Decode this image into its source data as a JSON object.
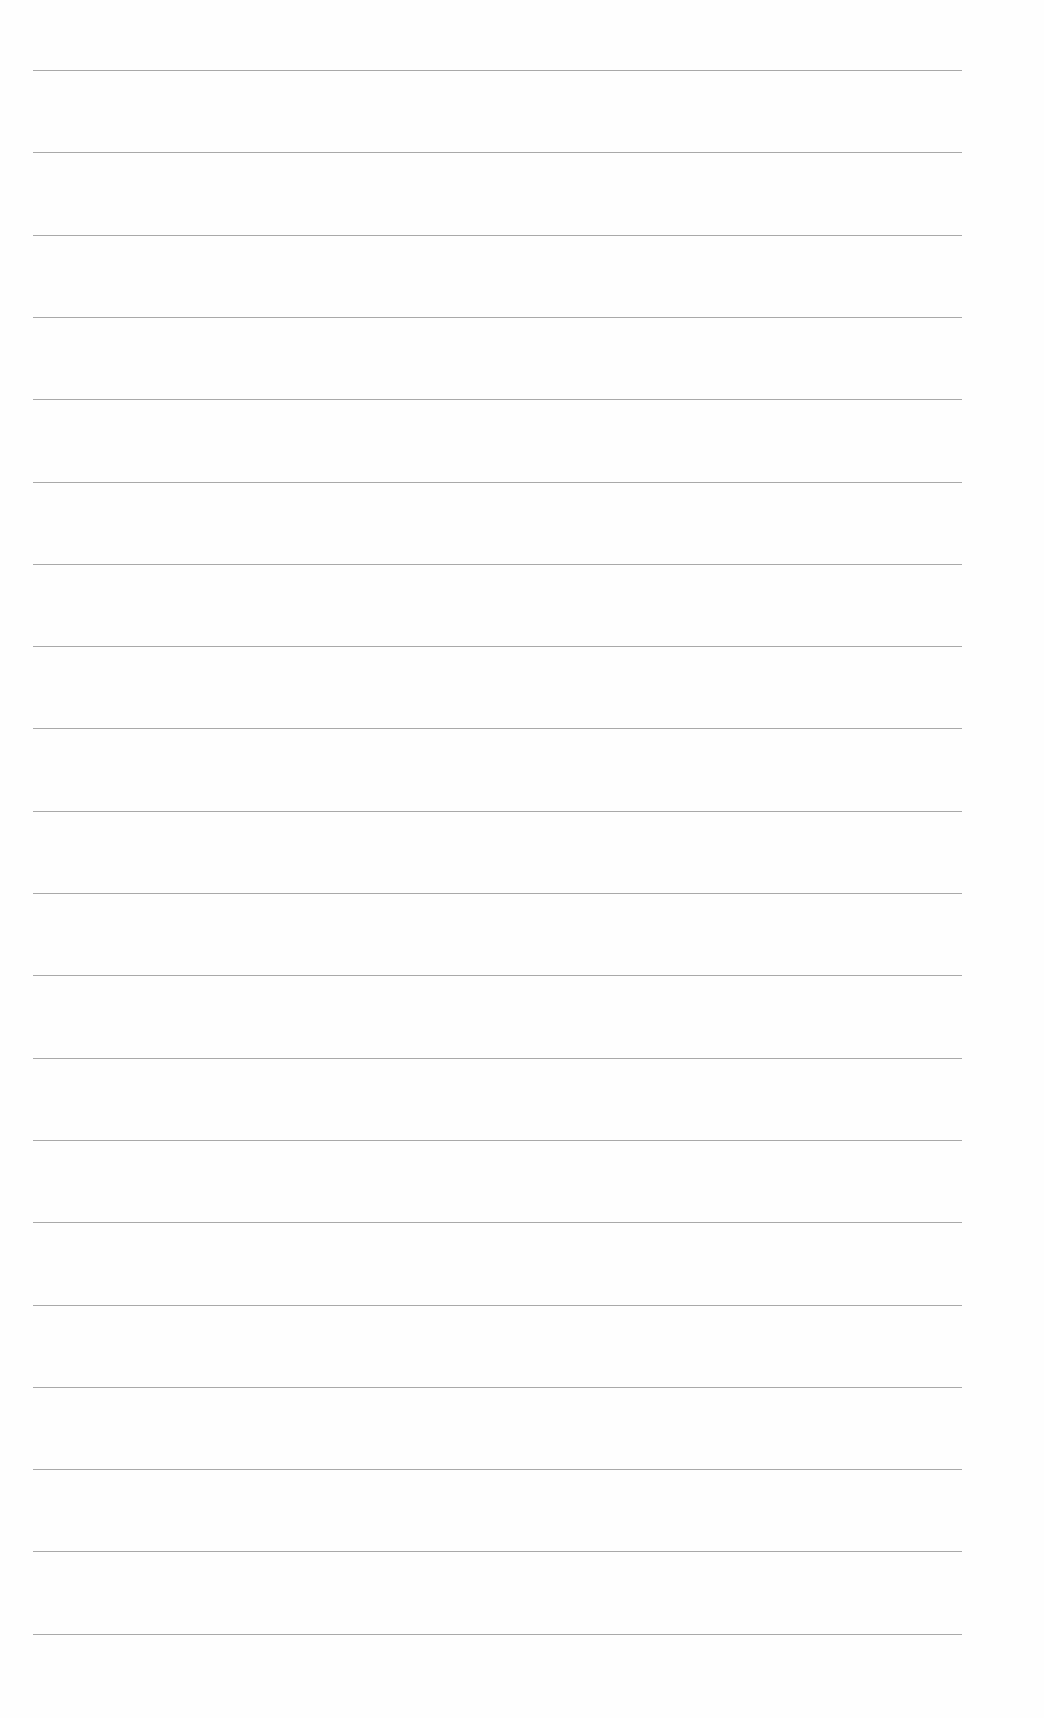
{
  "page": {
    "type": "lined-paper",
    "background_color": "#fefefe",
    "rule_color": "#9a9a9a",
    "rule_count": 20,
    "rule_left_px": 33,
    "rule_right_px": 962,
    "first_rule_y_px": 70,
    "rule_spacing_px": 82.3,
    "text_content": ""
  }
}
